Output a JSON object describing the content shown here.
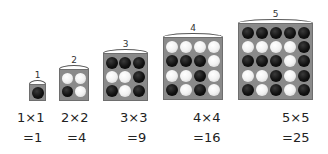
{
  "figure": {
    "grids": [
      {
        "label": "1",
        "size": 1,
        "x": 29,
        "y": 84,
        "w": 17,
        "h": 17,
        "disc": 12,
        "pattern": [
          "B"
        ]
      },
      {
        "label": "2",
        "size": 2,
        "x": 59,
        "y": 69,
        "w": 30,
        "h": 32,
        "disc": 11,
        "pattern": [
          "WW",
          "BW"
        ]
      },
      {
        "label": "3",
        "size": 3,
        "x": 103,
        "y": 53,
        "w": 45,
        "h": 48,
        "disc": 12,
        "pattern": [
          "BBB",
          "WWB",
          "BWB"
        ]
      },
      {
        "label": "4",
        "size": 4,
        "x": 163,
        "y": 37,
        "w": 60,
        "h": 63,
        "disc": 12,
        "pattern": [
          "WWWW",
          "BBBW",
          "WWBW",
          "BWBW"
        ]
      },
      {
        "label": "5",
        "size": 5,
        "x": 238,
        "y": 23,
        "w": 75,
        "h": 77,
        "disc": 12,
        "pattern": [
          "BBBBB",
          "WWWWB",
          "BBBWB",
          "WWBWB",
          "BWBWB"
        ]
      }
    ],
    "equations": [
      {
        "product": "1×1",
        "result": "=1",
        "px": 17,
        "rx": 23
      },
      {
        "product": "2×2",
        "result": "=4",
        "px": 61,
        "rx": 67
      },
      {
        "product": "3×3",
        "result": "=9",
        "px": 120,
        "rx": 127
      },
      {
        "product": "4×4",
        "result": "=16",
        "px": 193,
        "rx": 193
      },
      {
        "product": "5×5",
        "result": "=25",
        "px": 282,
        "rx": 282
      }
    ],
    "colors": {
      "board": "#8a8a8a",
      "black_disc": "#111111",
      "white_disc": "#f2f2f2"
    }
  }
}
